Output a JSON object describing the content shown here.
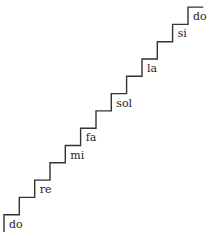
{
  "diagram": {
    "stroke_color": "#333333",
    "background": "#ffffff",
    "step_count": 13,
    "origin": {
      "x": 4,
      "y": 232
    },
    "step_dx": 15.33,
    "step_dy": 17.3,
    "labels": [
      {
        "text": "do",
        "step": 1
      },
      {
        "text": "re",
        "step": 3
      },
      {
        "text": "mi",
        "step": 5
      },
      {
        "text": "fa",
        "step": 6
      },
      {
        "text": "sol",
        "step": 8
      },
      {
        "text": "la",
        "step": 10
      },
      {
        "text": "si",
        "step": 12
      },
      {
        "text": "do",
        "step": 13
      }
    ]
  }
}
